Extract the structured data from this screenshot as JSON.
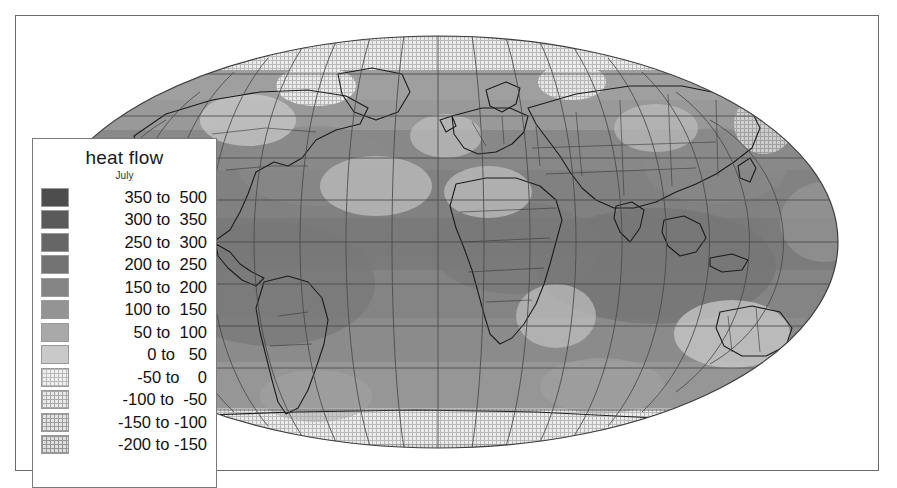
{
  "figure": {
    "title": "heat flow",
    "subtitle": "July"
  },
  "legend": {
    "title": "heat flow",
    "subtitle": "July",
    "entries": [
      {
        "label": "350 to  500",
        "from": 350,
        "to": 500,
        "color": "#4d4d4d",
        "pattern": "solid"
      },
      {
        "label": "300 to  350",
        "from": 300,
        "to": 350,
        "color": "#5a5a5a",
        "pattern": "solid"
      },
      {
        "label": "250 to  300",
        "from": 250,
        "to": 300,
        "color": "#666666",
        "pattern": "solid"
      },
      {
        "label": "200 to  250",
        "from": 200,
        "to": 250,
        "color": "#737373",
        "pattern": "solid"
      },
      {
        "label": "150 to  200",
        "from": 150,
        "to": 200,
        "color": "#848484",
        "pattern": "solid"
      },
      {
        "label": "100 to  150",
        "from": 100,
        "to": 150,
        "color": "#949494",
        "pattern": "solid"
      },
      {
        "label": " 50 to  100",
        "from": 50,
        "to": 100,
        "color": "#a9a9a9",
        "pattern": "solid"
      },
      {
        "label": "  0 to   50",
        "from": 0,
        "to": 50,
        "color": "#c9c9c9",
        "pattern": "solid"
      },
      {
        "label": "-50 to    0",
        "from": -50,
        "to": 0,
        "color": "#f0f0f0",
        "pattern": "dither-a"
      },
      {
        "label": "-100 to  -50",
        "from": -100,
        "to": -50,
        "color": "#eaeaea",
        "pattern": "dither-b"
      },
      {
        "label": "-150 to -100",
        "from": -150,
        "to": -100,
        "color": "#e4e4e4",
        "pattern": "dither-c"
      },
      {
        "label": "-200 to -150",
        "from": -200,
        "to": -150,
        "color": "#dedede",
        "pattern": "dither-d"
      }
    ]
  },
  "map": {
    "projection": "mollweide",
    "center_lon": 20,
    "graticule": {
      "lon_step": 20,
      "lat_step": 20,
      "line_color": "#4a4a4a"
    },
    "ocean_fill": "#8e8e8e",
    "coastline_color": "#1f1f1f",
    "border_color": "#3a3a3a",
    "frame_color": "#6b6b6b"
  },
  "chart_data": {
    "type": "heatmap",
    "title": "heat flow",
    "subtitle": "July",
    "xlabel": "",
    "ylabel": "",
    "unit": "W m-2",
    "projection": "Mollweide world map",
    "legend_position": "left",
    "grid": true,
    "categories": [
      "350 to 500",
      "300 to 350",
      "250 to 300",
      "200 to 250",
      "150 to 200",
      "100 to 150",
      "50 to 100",
      "0 to 50",
      "-50 to 0",
      "-100 to -50",
      "-150 to -100",
      "-200 to -150"
    ],
    "bin_edges": [
      -200,
      -150,
      -100,
      -50,
      0,
      50,
      100,
      150,
      200,
      250,
      300,
      350,
      500
    ],
    "colors": [
      "#4d4d4d",
      "#5a5a5a",
      "#666666",
      "#737373",
      "#848484",
      "#949494",
      "#a9a9a9",
      "#c9c9c9",
      "#f0f0f0",
      "#eaeaea",
      "#e4e4e4",
      "#dedede"
    ],
    "zrange": [
      -200,
      500
    ]
  }
}
